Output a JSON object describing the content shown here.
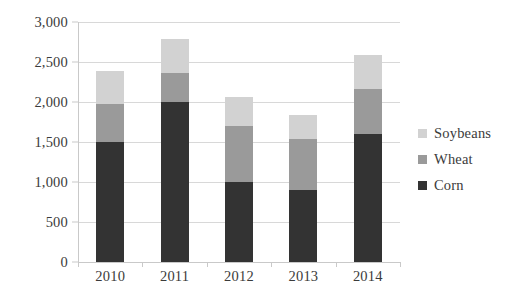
{
  "chart_data": {
    "type": "bar",
    "subtype": "stacked-vertical",
    "title": "",
    "subtitle": "",
    "xlabel": "",
    "ylabel": "",
    "categories": [
      "2010",
      "2011",
      "2012",
      "2013",
      "2014"
    ],
    "series": [
      {
        "name": "Corn",
        "color": "#333333",
        "values": [
          1500,
          2000,
          1000,
          900,
          1600
        ]
      },
      {
        "name": "Wheat",
        "color": "#9a9a9a",
        "values": [
          480,
          360,
          700,
          640,
          560
        ]
      },
      {
        "name": "Soybeans",
        "color": "#d2d2d2",
        "values": [
          410,
          430,
          360,
          300,
          430
        ]
      }
    ],
    "stack_order_bottom_to_top": [
      "Corn",
      "Wheat",
      "Soybeans"
    ],
    "totals": [
      2390,
      2790,
      2060,
      1840,
      2590
    ],
    "ylim": [
      0,
      3000
    ],
    "ytick_values": [
      0,
      500,
      1000,
      1500,
      2000,
      2500,
      3000
    ],
    "ytick_labels": [
      "0",
      "500",
      "1,000",
      "1,500",
      "2,000",
      "2,500",
      "3,000"
    ],
    "grid": true,
    "grid_axis": "y",
    "legend": true,
    "legend_position": "right",
    "legend_entries": [
      "Soybeans",
      "Wheat",
      "Corn"
    ],
    "annotations": []
  },
  "colors": {
    "background": "#ffffff",
    "gridline": "#d8d8d8",
    "axis": "#c9c9c9",
    "text": "#3b3b3b",
    "corn": "#333333",
    "wheat": "#9a9a9a",
    "soybeans": "#d2d2d2"
  }
}
